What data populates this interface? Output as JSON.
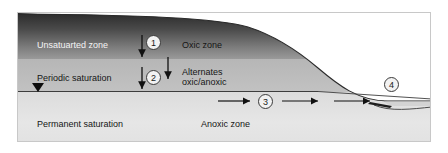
{
  "figure": {
    "caption_remnant": "·  ··    ·           ··",
    "type": "cross-section diagram",
    "accent_colors": {
      "unsaturated_fill_top": "#2b2b2b",
      "unsaturated_fill_bottom": "#9a9a9a",
      "periodic_fill": "#bcbcbc",
      "permanent_fill": "#e2e2e2",
      "surface_line": "#2a2a2a",
      "water_surface": "#8c8c8c",
      "border": "#c8c8c8",
      "arrow": "#111111"
    }
  },
  "zones": {
    "left_column": [
      {
        "label": "Unsatuarted zone",
        "tone": "light"
      },
      {
        "label": "Periodic saturation",
        "tone": "dark"
      },
      {
        "label": "Permanent saturation",
        "tone": "dark"
      }
    ],
    "right_column": [
      {
        "label": "Oxic zone",
        "tone": "dark"
      },
      {
        "label": "Alternates",
        "tone": "dark"
      },
      {
        "label": "oxic/anoxic",
        "tone": "dark"
      },
      {
        "label": "Anoxic zone",
        "tone": "dark"
      }
    ]
  },
  "callouts": [
    {
      "id": "1",
      "meaning": "infiltration through unsaturated zone"
    },
    {
      "id": "2",
      "meaning": "percolation through periodically saturated zone"
    },
    {
      "id": "3",
      "meaning": "lateral groundwater flow in permanently saturated zone"
    },
    {
      "id": "4",
      "meaning": "discharge to surface water body"
    }
  ],
  "markers": {
    "water_table_symbol": "water-table-triangle"
  }
}
